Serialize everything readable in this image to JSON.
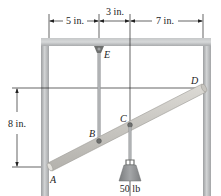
{
  "figure": {
    "dimensions": {
      "top": [
        "5 in.",
        "3 in.",
        "7 in."
      ],
      "left": "8 in."
    },
    "points": {
      "A": "A",
      "B": "B",
      "C": "C",
      "D": "D",
      "E": "E"
    },
    "load": "50 lb",
    "colors": {
      "frame": "#b4b6b8",
      "frame_edge": "#8e9092",
      "bar": "#c9c7c2",
      "bar_edge": "#9a9893",
      "rod": "#a9abad",
      "pin": "#6e706f",
      "weight": "#8a8c8e",
      "line": "#222222"
    }
  }
}
